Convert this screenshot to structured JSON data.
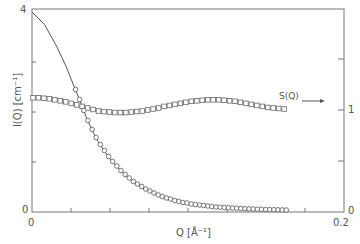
{
  "chart_data": {
    "type": "scatter",
    "title": "",
    "xlabel": "Q [Å⁻¹]",
    "ylabel": "I(Q) [cm⁻¹]",
    "y2label": "S(Q)",
    "xlim": [
      0,
      0.2
    ],
    "ylim": [
      0,
      4
    ],
    "y2lim": [
      0,
      2
    ],
    "x_tick_labels": [
      "0",
      "0.2"
    ],
    "y_tick_labels": [
      "0",
      "4"
    ],
    "y2_tick_labels": [
      "0",
      "1"
    ],
    "grid": false,
    "annotations": [
      {
        "text": "S(Q)",
        "arrow": "right",
        "x": 0.168,
        "y2": 1.12
      }
    ],
    "series": [
      {
        "name": "I(Q) data",
        "marker": "circle",
        "axis": "left",
        "x": [
          0.0279,
          0.0305,
          0.0332,
          0.0358,
          0.0385,
          0.0411,
          0.0438,
          0.0464,
          0.0491,
          0.0517,
          0.0544,
          0.057,
          0.0597,
          0.0623,
          0.065,
          0.0676,
          0.0703,
          0.0729,
          0.0756,
          0.0782,
          0.0809,
          0.0835,
          0.0862,
          0.0888,
          0.0915,
          0.0941,
          0.0968,
          0.0994,
          0.1021,
          0.1047,
          0.1074,
          0.11,
          0.1127,
          0.1153,
          0.118,
          0.1206,
          0.1233,
          0.1259,
          0.1286,
          0.1312,
          0.1339,
          0.1365,
          0.1392,
          0.1418,
          0.1445,
          0.1471,
          0.1498,
          0.1524,
          0.1551,
          0.1577,
          0.1604,
          0.163
        ],
        "y": [
          2.44,
          2.24,
          2.02,
          1.82,
          1.64,
          1.48,
          1.34,
          1.22,
          1.1,
          1.0,
          0.91,
          0.82,
          0.74,
          0.67,
          0.6,
          0.55,
          0.5,
          0.45,
          0.41,
          0.37,
          0.33,
          0.3,
          0.27,
          0.25,
          0.22,
          0.2,
          0.18,
          0.17,
          0.15,
          0.14,
          0.13,
          0.12,
          0.11,
          0.1,
          0.09,
          0.085,
          0.08,
          0.075,
          0.07,
          0.065,
          0.06,
          0.056,
          0.052,
          0.049,
          0.046,
          0.043,
          0.04,
          0.038,
          0.036,
          0.034,
          0.032,
          0.03
        ]
      },
      {
        "name": "I(Q) fit",
        "marker": "line",
        "axis": "left",
        "note": "solid curve from 4.0 at Q=0 decaying to ~0.03 at Q≈0.163"
      },
      {
        "name": "S(Q)",
        "marker": "square",
        "axis": "right",
        "x": [
          0.0,
          0.0035,
          0.007,
          0.0105,
          0.014,
          0.0175,
          0.021,
          0.0245,
          0.028,
          0.0315,
          0.035,
          0.0385,
          0.042,
          0.0455,
          0.049,
          0.0525,
          0.056,
          0.0595,
          0.063,
          0.0665,
          0.07,
          0.0735,
          0.077,
          0.0805,
          0.084,
          0.0875,
          0.091,
          0.0945,
          0.098,
          0.1015,
          0.105,
          0.1085,
          0.112,
          0.1155,
          0.119,
          0.1225,
          0.126,
          0.1295,
          0.133,
          0.1365,
          0.14,
          0.1435,
          0.147,
          0.1505,
          0.154,
          0.1575,
          0.161
        ],
        "y": [
          1.12,
          1.12,
          1.115,
          1.11,
          1.1,
          1.09,
          1.08,
          1.065,
          1.05,
          1.035,
          1.02,
          1.005,
          0.99,
          0.985,
          0.98,
          0.975,
          0.975,
          0.975,
          0.98,
          0.985,
          0.99,
          1.0,
          1.01,
          1.02,
          1.035,
          1.045,
          1.055,
          1.065,
          1.075,
          1.085,
          1.09,
          1.095,
          1.1,
          1.1,
          1.1,
          1.095,
          1.09,
          1.085,
          1.075,
          1.065,
          1.055,
          1.045,
          1.035,
          1.025,
          1.02,
          1.015,
          1.01
        ]
      }
    ]
  },
  "labels": {
    "y_top": "4",
    "y_zero": "0",
    "x_zero": "0",
    "x_end": "0.2",
    "y2_one": "1",
    "y2_zero": "0",
    "xlabel": "Q [Å⁻¹]",
    "ylabel": "I(Q) [cm⁻¹]",
    "sq_label": "S(Q)"
  }
}
